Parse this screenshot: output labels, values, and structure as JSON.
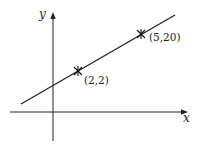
{
  "diagram": {
    "type": "line-through-two-points",
    "axes": {
      "x_label": "x",
      "y_label": "y"
    },
    "points": [
      {
        "label": "(2,2)",
        "x": 2,
        "y": 2
      },
      {
        "label": "(5,20)",
        "x": 5,
        "y": 20
      }
    ],
    "colors": {
      "stroke": "#222222",
      "background": "#ffffff"
    }
  }
}
